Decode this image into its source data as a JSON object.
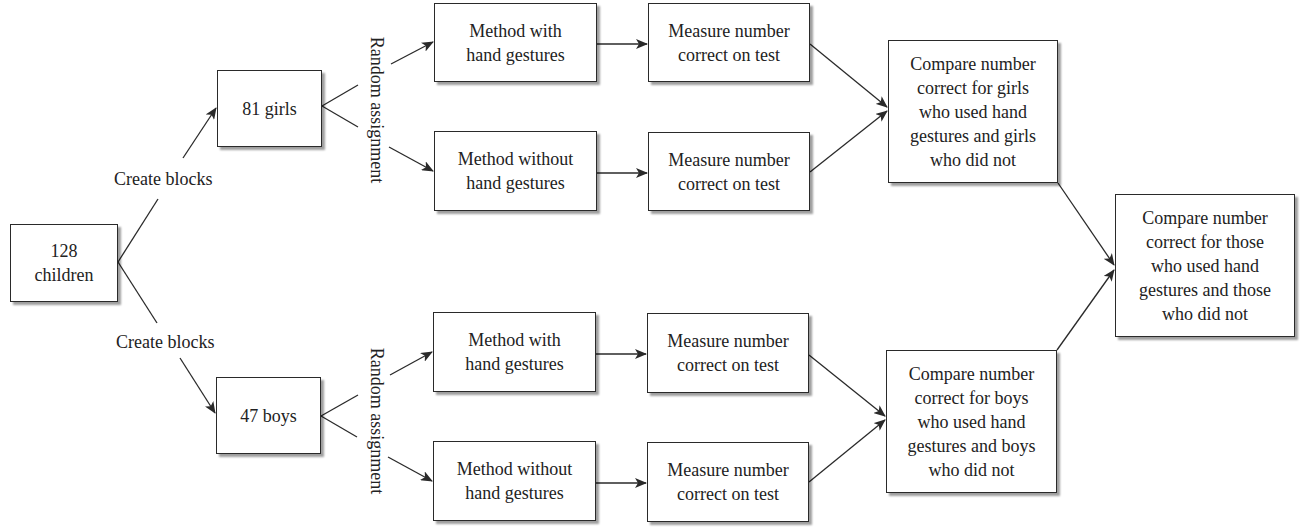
{
  "diagram": {
    "type": "flowchart",
    "start": {
      "label": "128\nchildren"
    },
    "block_label": "Create blocks",
    "assignment_label": "Random assignment",
    "blocks": [
      {
        "name": "girls",
        "label": "81 girls",
        "treatments": [
          {
            "label": "Method with\nhand gestures",
            "measure": "Measure number\ncorrect on test"
          },
          {
            "label": "Method without\nhand gestures",
            "measure": "Measure number\ncorrect on test"
          }
        ],
        "compare": "Compare number\ncorrect for girls\nwho used hand\ngestures and girls\nwho did not"
      },
      {
        "name": "boys",
        "label": "47 boys",
        "treatments": [
          {
            "label": "Method with\nhand gestures",
            "measure": "Measure number\ncorrect on test"
          },
          {
            "label": "Method without\nhand gestures",
            "measure": "Measure number\ncorrect on test"
          }
        ],
        "compare": "Compare number\ncorrect for boys\nwho used hand\ngestures and boys\nwho did not"
      }
    ],
    "final": {
      "label": "Compare number\ncorrect for those\nwho used hand\ngestures and those\nwho did not"
    },
    "colors": {
      "line": "#2a2a2a",
      "box_fill": "#ffffff",
      "text": "#222222"
    }
  }
}
